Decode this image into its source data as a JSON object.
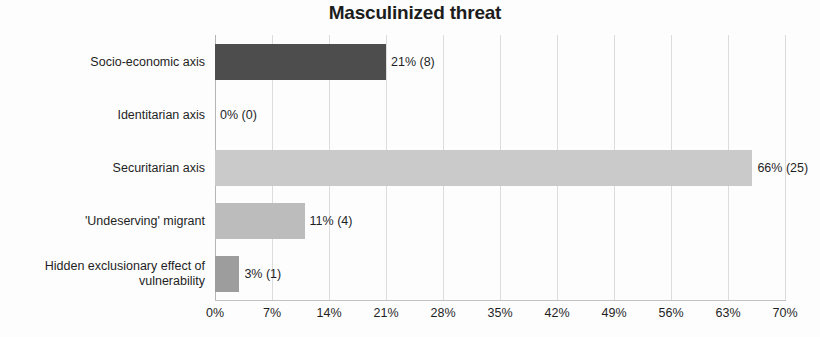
{
  "chart_data": {
    "type": "bar",
    "orientation": "horizontal",
    "title": "Masculinized threat",
    "xlabel": "",
    "ylabel": "",
    "xlim": [
      0,
      70
    ],
    "x_tick_labels": [
      "0%",
      "7%",
      "14%",
      "21%",
      "28%",
      "35%",
      "42%",
      "49%",
      "56%",
      "63%",
      "70%"
    ],
    "x_tick_values": [
      0,
      7,
      14,
      21,
      28,
      35,
      42,
      49,
      56,
      63,
      70
    ],
    "grid": "vertical",
    "legend": "none",
    "categories": [
      "Socio-economic axis",
      "Identitarian axis",
      "Securitarian axis",
      "'Undeserving' migrant",
      "Hidden exclusionary effect of vulnerability"
    ],
    "values": [
      21,
      0,
      66,
      11,
      3
    ],
    "counts": [
      8,
      0,
      25,
      4,
      1
    ],
    "data_labels": [
      "21% (8)",
      "0% (0)",
      "66% (25)",
      "11% (4)",
      "3% (1)"
    ],
    "bar_colors": [
      "#4d4d4d",
      "#d9d9d9",
      "#cacaca",
      "#bcbcbc",
      "#9d9d9d"
    ],
    "bars": [
      {
        "category": "Socio-economic axis",
        "label_lines": [
          "Socio-economic axis"
        ],
        "value": 21,
        "count": 8,
        "data_label": "21% (8)",
        "color": "#4d4d4d"
      },
      {
        "category": "Identitarian axis",
        "label_lines": [
          "Identitarian axis"
        ],
        "value": 0,
        "count": 0,
        "data_label": "0% (0)",
        "color": "#d9d9d9"
      },
      {
        "category": "Securitarian axis",
        "label_lines": [
          "Securitarian axis"
        ],
        "value": 66,
        "count": 25,
        "data_label": "66% (25)",
        "color": "#cacaca"
      },
      {
        "category": "'Undeserving' migrant",
        "label_lines": [
          "'Undeserving' migrant"
        ],
        "value": 11,
        "count": 4,
        "data_label": "11% (4)",
        "color": "#bcbcbc"
      },
      {
        "category": "Hidden exclusionary effect of vulnerability",
        "label_lines": [
          "Hidden exclusionary effect of",
          "vulnerability"
        ],
        "value": 3,
        "count": 1,
        "data_label": "3% (1)",
        "color": "#9d9d9d"
      }
    ]
  }
}
